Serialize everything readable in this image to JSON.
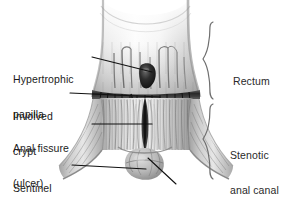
{
  "figure": {
    "background_color": "#ffffff",
    "width": 289,
    "height": 212
  },
  "labels": {
    "left": [
      {
        "id": "hypertrophic-papilla",
        "line1": "Hypertrophic",
        "line2": "papilla",
        "x": 13,
        "y": 51
      },
      {
        "id": "involved-crypt",
        "line1": "Involved",
        "line2": "crypt",
        "x": 13,
        "y": 88
      },
      {
        "id": "anal-fissure",
        "line1": "Anal fissure",
        "line2": "(ulcer)",
        "x": 13,
        "y": 120
      },
      {
        "id": "sentinel-pile",
        "line1": "Sentinel",
        "line2": "pile",
        "x": 13,
        "y": 160
      }
    ],
    "right": [
      {
        "id": "rectum",
        "line1": "Rectum",
        "line2": "",
        "x": 233,
        "y": 53
      },
      {
        "id": "stenotic-anal-canal",
        "line1": "Stenotic",
        "line2": "anal canal",
        "x": 230,
        "y": 127
      }
    ],
    "bottom": [
      {
        "id": "anal-verge",
        "line1": "Anal verge",
        "line2": "",
        "x": 178,
        "y": 188
      }
    ]
  },
  "braces": [
    {
      "id": "rectum-brace",
      "label_ref": "rectum",
      "top": 21,
      "bottom": 100,
      "x": 212
    },
    {
      "id": "stenotic-anal-canal-brace",
      "label_ref": "stenotic-anal-canal",
      "top": 103,
      "bottom": 181,
      "x": 212
    }
  ],
  "leaders": [
    {
      "id": "leader-hypertrophic-papilla",
      "from": [
        92,
        57
      ],
      "to": [
        152,
        72
      ]
    },
    {
      "id": "leader-involved-crypt",
      "from": [
        70,
        93
      ],
      "to": [
        160,
        97
      ]
    },
    {
      "id": "leader-anal-fissure",
      "from": [
        92,
        124
      ],
      "to": [
        152,
        124
      ]
    },
    {
      "id": "leader-sentinel-pile",
      "from": [
        72,
        165
      ],
      "to": [
        146,
        169
      ]
    },
    {
      "id": "leader-anal-verge",
      "from": [
        176,
        184
      ],
      "to": [
        148,
        158
      ]
    }
  ],
  "anatomy": {
    "colors": {
      "rectum_wall_light": "#f2f2f2",
      "rectum_wall_mid": "#cfcfcf",
      "rectum_wall_dark": "#9a9a9a",
      "canal_shadow": "#6f6f6f",
      "papilla_dark": "#232323",
      "crypt_line": "#3a3a3a",
      "outline": "#7d7d7d",
      "fissure": "#4a4a4a",
      "pile": "#b5b5b5"
    },
    "parts": [
      {
        "id": "rectum-ampulla",
        "name": "Rectal ampulla (funnel)"
      },
      {
        "id": "columns-of-morgagni",
        "name": "Columns of Morgagni striations"
      },
      {
        "id": "hypertrophic-papilla-mass",
        "name": "Hypertrophic papilla (dark nodule)"
      },
      {
        "id": "dentate-line",
        "name": "Dentate line / crypt band"
      },
      {
        "id": "anal-canal",
        "name": "Stenotic anal canal"
      },
      {
        "id": "anal-fissure-ulcer",
        "name": "Anal fissure (ulcer) midline defect"
      },
      {
        "id": "sentinel-pile-tag",
        "name": "Sentinel pile skin tag"
      },
      {
        "id": "anal-verge-margin",
        "name": "Anal verge margin"
      }
    ]
  }
}
